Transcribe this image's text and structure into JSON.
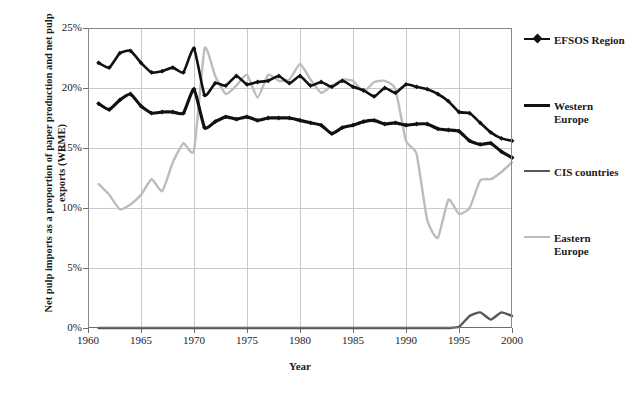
{
  "chart_data": {
    "type": "line",
    "title": "",
    "xlabel": "Year",
    "ylabel": "Net pulp imports as a proportion of paper production and net pulp exports (WRME)",
    "xlim": [
      1960,
      2000
    ],
    "ylim": [
      0,
      25
    ],
    "grid": true,
    "legend_position": "right",
    "xticks": [
      "1960",
      "1965",
      "1970",
      "1975",
      "1980",
      "1985",
      "1990",
      "1995",
      "2000"
    ],
    "ytick_labels": [
      "0%",
      "5%",
      "10%",
      "15%",
      "20%",
      "25%"
    ],
    "ytick_values": [
      0,
      5,
      10,
      15,
      20,
      25
    ],
    "x": [
      1961,
      1962,
      1963,
      1964,
      1965,
      1966,
      1967,
      1968,
      1969,
      1970,
      1971,
      1972,
      1973,
      1974,
      1975,
      1976,
      1977,
      1978,
      1979,
      1980,
      1981,
      1982,
      1983,
      1984,
      1985,
      1986,
      1987,
      1988,
      1989,
      1990,
      1991,
      1992,
      1993,
      1994,
      1995,
      1996,
      1997,
      1998,
      1999,
      2000
    ],
    "series": [
      {
        "name": "EFSOS Region",
        "color": "#111111",
        "marker": "diamond",
        "values": [
          22.1,
          21.7,
          22.9,
          23.1,
          22.1,
          21.3,
          21.4,
          21.7,
          21.3,
          23.3,
          19.4,
          20.4,
          20.2,
          21.0,
          20.3,
          20.5,
          20.6,
          21.0,
          20.4,
          21.0,
          20.2,
          20.5,
          20.1,
          20.6,
          20.1,
          19.8,
          19.3,
          20.0,
          19.6,
          20.3,
          20.1,
          19.9,
          19.5,
          18.9,
          18.0,
          17.9,
          17.1,
          16.3,
          15.8,
          15.6
        ]
      },
      {
        "name": "Western Europe",
        "color": "#111111",
        "marker": "diamond",
        "values": [
          18.7,
          18.2,
          19.0,
          19.5,
          18.5,
          17.9,
          18.0,
          18.0,
          17.9,
          19.9,
          16.7,
          17.2,
          17.6,
          17.4,
          17.6,
          17.3,
          17.5,
          17.5,
          17.5,
          17.3,
          17.1,
          16.9,
          16.2,
          16.7,
          16.9,
          17.2,
          17.3,
          17.0,
          17.1,
          16.9,
          17.0,
          17.0,
          16.6,
          16.5,
          16.4,
          15.6,
          15.3,
          15.4,
          14.7,
          14.2
        ]
      },
      {
        "name": "CIS countries",
        "color": "#585858",
        "marker": "none",
        "values": [
          0,
          0,
          0,
          0,
          0,
          0,
          0,
          0,
          0,
          0,
          0,
          0,
          0,
          0,
          0,
          0,
          0,
          0,
          0,
          0,
          0,
          0,
          0,
          0,
          0,
          0,
          0,
          0,
          0,
          0,
          0,
          0,
          0,
          0,
          0.1,
          1.0,
          1.3,
          0.7,
          1.3,
          1.0
        ]
      },
      {
        "name": "Eastern Europe",
        "color": "#bcbcbc",
        "marker": "none",
        "values": [
          12.0,
          11.1,
          9.9,
          10.3,
          11.1,
          12.4,
          11.4,
          13.8,
          15.4,
          14.8,
          23.3,
          21.0,
          19.5,
          20.2,
          21.1,
          19.2,
          21.1,
          20.6,
          20.7,
          22.0,
          20.7,
          19.6,
          20.2,
          20.7,
          20.6,
          19.7,
          20.5,
          20.6,
          19.9,
          15.6,
          14.5,
          9.0,
          7.5,
          10.7,
          9.5,
          10.0,
          12.3,
          12.4,
          13.0,
          13.8
        ]
      }
    ]
  },
  "axis_titles": {
    "y": "Net pulp imports as a proportion of paper production and net pulp exports (WRME)",
    "x": "Year"
  },
  "legend": {
    "items": [
      {
        "label": "EFSOS Region",
        "color": "#111111",
        "width": 2.6,
        "marker": true
      },
      {
        "label": "Western Europe",
        "color": "#111111",
        "width": 3.2,
        "marker": false
      },
      {
        "label": "CIS countries",
        "color": "#585858",
        "width": 2.4,
        "marker": false
      },
      {
        "label": "Eastern Europe",
        "color": "#bcbcbc",
        "width": 2.4,
        "marker": false
      }
    ]
  }
}
